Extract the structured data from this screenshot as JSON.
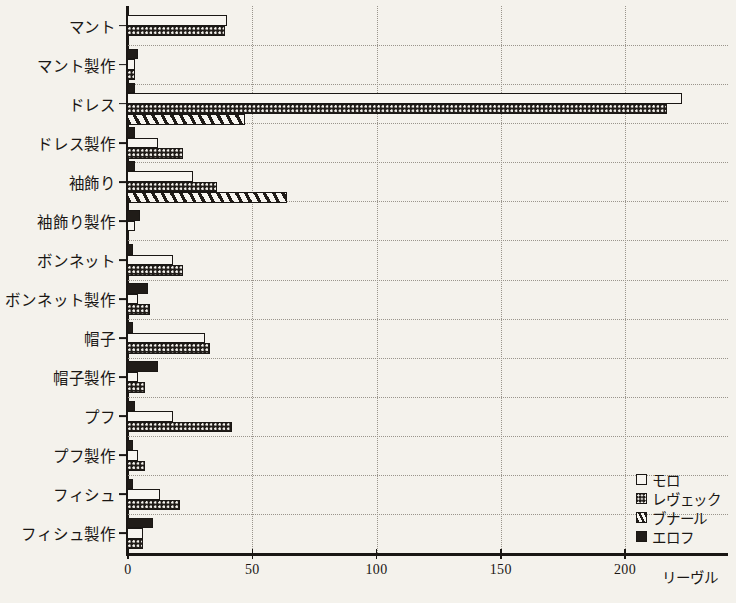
{
  "chart_data": {
    "type": "bar",
    "orientation": "horizontal",
    "title": "",
    "xlabel": "リーヴル",
    "ylabel": "",
    "xlim": [
      0,
      241
    ],
    "xticks": [
      0,
      50,
      100,
      150,
      200
    ],
    "xtick_labels": [
      "0",
      "50",
      "100",
      "150",
      "200"
    ],
    "grid": "dotted both axes",
    "legend_position": "bottom-right",
    "categories": [
      "マント",
      "マント製作",
      "ドレス",
      "ドレス製作",
      "袖飾り",
      "袖飾り製作",
      "ボンネット",
      "ボンネット製作",
      "帽子",
      "帽子製作",
      "プフ",
      "プフ製作",
      "フィシュ",
      "フィシュ製作"
    ],
    "series": [
      {
        "name": "モロ",
        "pattern": "white",
        "values": [
          40,
          3,
          223,
          12,
          26,
          3,
          18,
          4,
          31,
          4,
          18,
          4,
          13,
          6
        ]
      },
      {
        "name": "レヴェック",
        "pattern": "dotted",
        "values": [
          39,
          3,
          217,
          22,
          36,
          0,
          22,
          9,
          33,
          7,
          42,
          7,
          21,
          6
        ]
      },
      {
        "name": "ブナール",
        "pattern": "diagonal-hatch",
        "values": [
          0,
          0,
          47,
          0,
          64,
          0,
          0,
          0,
          0,
          0,
          0,
          0,
          0,
          0
        ]
      },
      {
        "name": "エロフ",
        "pattern": "solid-black",
        "values": [
          0,
          4,
          3,
          3,
          3,
          5,
          2,
          8,
          2,
          12,
          3,
          2,
          2,
          10
        ]
      }
    ]
  },
  "legend": {
    "entries": [
      {
        "label": "モロ",
        "pattern": "white"
      },
      {
        "label": "レヴェック",
        "pattern": "dotted"
      },
      {
        "label": "ブナール",
        "pattern": "diagonal-hatch"
      },
      {
        "label": "エロフ",
        "pattern": "solid-black"
      }
    ]
  },
  "colors": {
    "ink": "#1a1714",
    "paper": "#f4f2ec",
    "grid": "#9a958c"
  }
}
